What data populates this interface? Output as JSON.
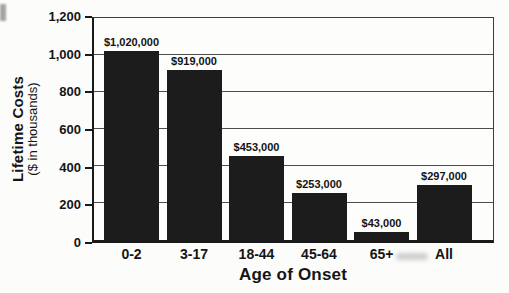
{
  "chart_data": {
    "type": "bar",
    "title": "",
    "xlabel": "Age of Onset",
    "ylabel": "Lifetime Costs",
    "ylabel_sub": "($ in thousands)",
    "categories": [
      "0-2",
      "3-17",
      "18-44",
      "45-64",
      "65+",
      "All"
    ],
    "values": [
      1020,
      919,
      453,
      253,
      43,
      297
    ],
    "bar_labels": [
      "$1,020,000",
      "$919,000",
      "$453,000",
      "$253,000",
      "$43,000",
      "$297,000"
    ],
    "ylim": [
      0,
      1200
    ],
    "ytick_interval": 200,
    "ytick_labels": [
      "0",
      "200",
      "400",
      "600",
      "800",
      "1,000",
      "1,200"
    ],
    "grid": true,
    "legend": "none",
    "bar_color": "#1c1c1c",
    "grid_color": "#4d4d4d",
    "frame_color": "#1a1a1a"
  }
}
